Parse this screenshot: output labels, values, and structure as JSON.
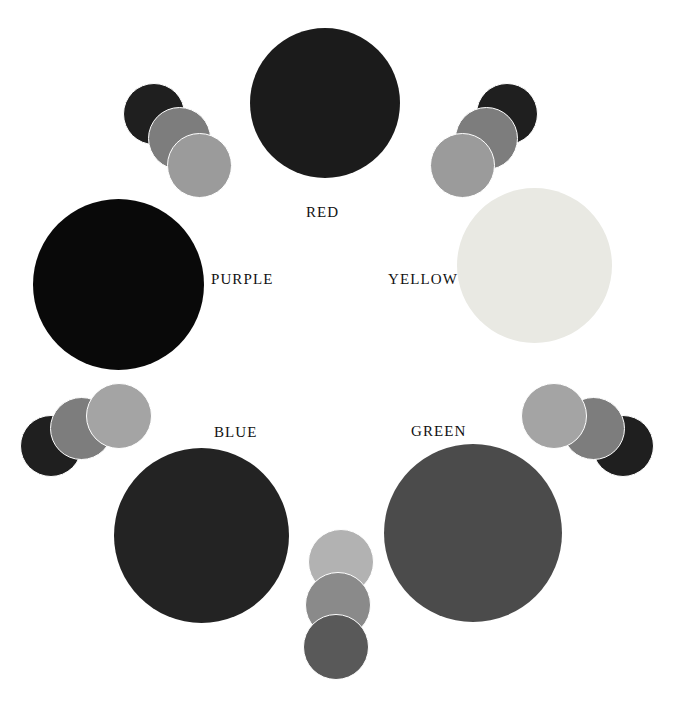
{
  "figure": {
    "background": "#ffffff",
    "width": 673,
    "height": 706
  },
  "chart_data": {
    "type": "scatter",
    "xlabel": "",
    "ylabel": "",
    "layout": "hexagonal ring of six labelled primary/secondary discs with interleaved three-disc tonal clusters",
    "labels": [
      "RED",
      "YELLOW",
      "GREEN",
      "BLUE",
      "PURPLE"
    ],
    "legend": "none",
    "grid": false
  },
  "main_circles": [
    {
      "name": "red",
      "label": "RED",
      "color": "#1b1b1b",
      "x": 250,
      "y": 28,
      "size": 150,
      "label_x": 306,
      "label_y": 205
    },
    {
      "name": "yellow",
      "label": "YELLOW",
      "color": "#e9e9e3",
      "x": 457,
      "y": 188,
      "size": 155,
      "label_x": 388,
      "label_y": 272
    },
    {
      "name": "green",
      "label": "GREEN",
      "color": "#4b4b4b",
      "x": 384,
      "y": 444,
      "size": 178,
      "label_x": 411,
      "label_y": 424
    },
    {
      "name": "blue",
      "label": "BLUE",
      "color": "#232323",
      "x": 114,
      "y": 448,
      "size": 175,
      "label_x": 214,
      "label_y": 425
    },
    {
      "name": "purple",
      "label": "PURPLE",
      "color": "#090909",
      "x": 33,
      "y": 199,
      "size": 171,
      "label_x": 211,
      "label_y": 272
    }
  ],
  "tonal_clusters": [
    {
      "name": "cluster-upper-left",
      "discs": [
        {
          "tone": "dark",
          "color": "#1f1f1f",
          "x": 123,
          "y": 83,
          "size": 62
        },
        {
          "tone": "medium",
          "color": "#7d7d7d",
          "x": 148,
          "y": 107,
          "size": 63
        },
        {
          "tone": "light",
          "color": "#9b9b9b",
          "x": 167,
          "y": 133,
          "size": 65
        }
      ]
    },
    {
      "name": "cluster-upper-right",
      "discs": [
        {
          "tone": "dark",
          "color": "#1f1f1f",
          "x": 476,
          "y": 83,
          "size": 62
        },
        {
          "tone": "medium",
          "color": "#7d7d7d",
          "x": 455,
          "y": 107,
          "size": 63
        },
        {
          "tone": "light",
          "color": "#9b9b9b",
          "x": 430,
          "y": 133,
          "size": 65
        }
      ]
    },
    {
      "name": "cluster-lower-left",
      "discs": [
        {
          "tone": "dark",
          "color": "#1f1f1f",
          "x": 20,
          "y": 415,
          "size": 62
        },
        {
          "tone": "medium",
          "color": "#7d7d7d",
          "x": 50,
          "y": 397,
          "size": 63
        },
        {
          "tone": "light",
          "color": "#a4a4a4",
          "x": 86,
          "y": 383,
          "size": 66
        }
      ]
    },
    {
      "name": "cluster-lower-right",
      "discs": [
        {
          "tone": "dark",
          "color": "#1f1f1f",
          "x": 592,
          "y": 415,
          "size": 62
        },
        {
          "tone": "medium",
          "color": "#7d7d7d",
          "x": 562,
          "y": 397,
          "size": 63
        },
        {
          "tone": "light",
          "color": "#a4a4a4",
          "x": 521,
          "y": 383,
          "size": 66
        }
      ]
    },
    {
      "name": "cluster-bottom-center",
      "discs": [
        {
          "tone": "light",
          "color": "#b2b2b2",
          "x": 308,
          "y": 529,
          "size": 66
        },
        {
          "tone": "medium",
          "color": "#8a8a8a",
          "x": 305,
          "y": 572,
          "size": 66
        },
        {
          "tone": "dark",
          "color": "#595959",
          "x": 303,
          "y": 614,
          "size": 66
        }
      ]
    }
  ]
}
